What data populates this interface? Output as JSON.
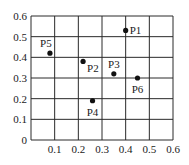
{
  "chart_data": {
    "type": "scatter",
    "title": "",
    "xlabel": "",
    "ylabel": "",
    "xlim": [
      0,
      0.6
    ],
    "ylim": [
      0,
      0.6
    ],
    "grid": true,
    "legend": null,
    "x_ticks": [
      "0.1",
      "0.2",
      "0.3",
      "0.4",
      "0.5",
      "0.6"
    ],
    "y_ticks": [
      "0",
      "0.1",
      "0.2",
      "0.3",
      "0.4",
      "0.5",
      "0.6"
    ],
    "points": [
      {
        "label": "P1",
        "x": 0.4,
        "y": 0.53,
        "label_pos": "right"
      },
      {
        "label": "P2",
        "x": 0.22,
        "y": 0.38,
        "label_pos": "below-right"
      },
      {
        "label": "P3",
        "x": 0.35,
        "y": 0.32,
        "label_pos": "above"
      },
      {
        "label": "P4",
        "x": 0.26,
        "y": 0.19,
        "label_pos": "below"
      },
      {
        "label": "P5",
        "x": 0.08,
        "y": 0.42,
        "label_pos": "above-left"
      },
      {
        "label": "P6",
        "x": 0.45,
        "y": 0.3,
        "label_pos": "below"
      }
    ]
  },
  "colors": {
    "grid": "#2a2a2a",
    "point": "#111111",
    "text": "#1a1a1a"
  }
}
